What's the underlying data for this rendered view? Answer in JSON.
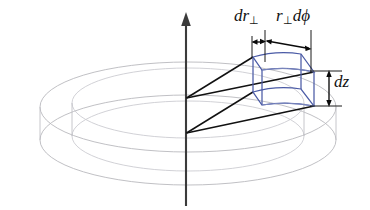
{
  "figure": {
    "name": "cylindrical-volume-element",
    "background_color": "#ffffff"
  },
  "colors": {
    "disk_outline": "#b9b9bd",
    "volume_element": "#4b5ba6",
    "axis": "#3b3b3b",
    "ray": "#111111",
    "dimension": "#0a0a0a",
    "label_text": "#111111"
  },
  "labels": {
    "radial_thickness": {
      "base": "dr",
      "subscript": "⊥",
      "full": "dr⊥"
    },
    "arc_length": {
      "base_r": "r",
      "subscript": "⊥",
      "base_d": "dϕ",
      "full": "r⊥dϕ"
    },
    "height": {
      "full": "dz"
    }
  },
  "elements": {
    "z_axis": "z-axis",
    "outer_top_circle": "outer-top-circle",
    "inner_top_circle": "inner-top-circle",
    "outer_bottom_circle": "outer-bottom-circle",
    "inner_bottom_circle": "inner-bottom-circle",
    "radial_ray_upper_outer": "radial-ray-upper-outer",
    "radial_ray_upper_inner": "radial-ray-upper-inner",
    "radial_ray_lower_outer": "radial-ray-lower-outer",
    "radial_ray_lower_inner": "radial-ray-lower-inner",
    "volume_cell": "volume-element-wedge",
    "dim_dr": "dimension-dr-perp",
    "dim_arc": "dimension-r-dphi",
    "dim_dz": "dimension-dz"
  }
}
